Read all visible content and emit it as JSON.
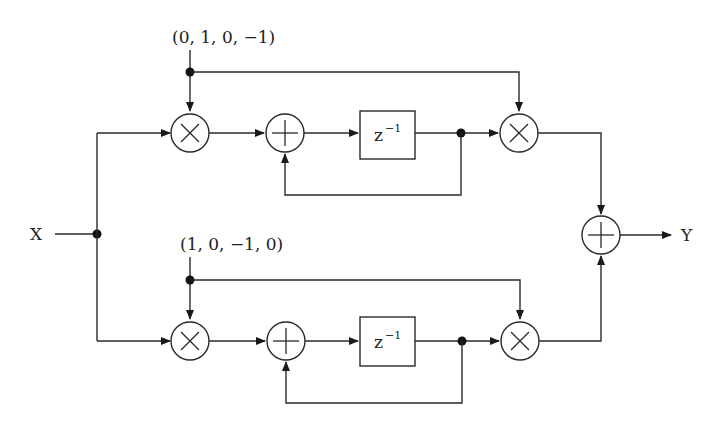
{
  "diagram": {
    "type": "signal-flow block diagram",
    "input_label": "X",
    "output_label": "Y",
    "upper_branch": {
      "coefficient_sequence": "(0, 1, 0, −1)",
      "delay_label": "z",
      "delay_exponent": "−1",
      "blocks": [
        "multiplier",
        "adder",
        "delay z^-1",
        "multiplier"
      ]
    },
    "lower_branch": {
      "coefficient_sequence": "(1, 0, −1, 0)",
      "delay_label": "z",
      "delay_exponent": "−1",
      "blocks": [
        "multiplier",
        "adder",
        "delay z^-1",
        "multiplier"
      ]
    },
    "output_block": "adder",
    "colors": {
      "line": "#2a2a2a",
      "background": "#ffffff"
    }
  }
}
